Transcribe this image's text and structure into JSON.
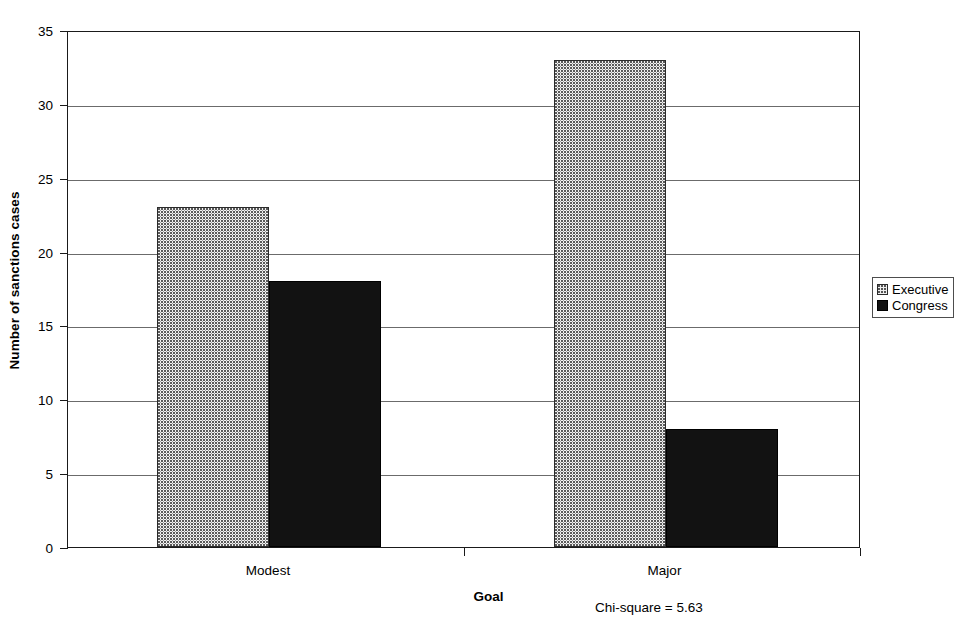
{
  "chart_data": {
    "type": "bar",
    "title": "",
    "xlabel": "Goal",
    "ylabel": "Number of sanctions cases",
    "categories": [
      "Modest",
      "Major"
    ],
    "series": [
      {
        "name": "Executive",
        "values": [
          23,
          33
        ],
        "color": "#f2f2f2",
        "pattern": "dotted"
      },
      {
        "name": "Congress",
        "values": [
          18,
          8
        ],
        "color": "#121212",
        "pattern": "solid"
      }
    ],
    "ylim": [
      0,
      35
    ],
    "ytick_values": [
      0,
      5,
      10,
      15,
      20,
      25,
      30,
      35
    ],
    "ytick_labels": [
      "0",
      "5",
      "10",
      "15",
      "20",
      "25",
      "30",
      "35"
    ],
    "grid": true,
    "grid_axis": "y",
    "legend_position": "right",
    "annotation": "Chi-square = 5.63"
  },
  "legend": {
    "entries": [
      {
        "label": "Executive",
        "swatch": "executive-swatch-icon"
      },
      {
        "label": "Congress",
        "swatch": "congress-swatch-icon"
      }
    ]
  },
  "axes": {
    "y_title": "Number of sanctions cases",
    "x_title": "Goal"
  },
  "annotation": {
    "text": "Chi-square = 5.63"
  }
}
